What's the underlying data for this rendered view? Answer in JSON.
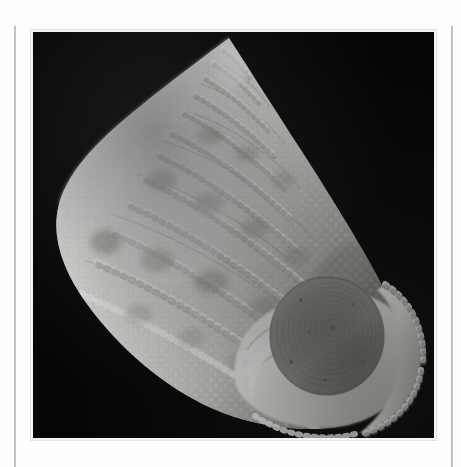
{
  "page": {
    "background_color": "#fefefe",
    "width": 461,
    "height": 467,
    "caption": ""
  },
  "margin_rules": {
    "left_label": "left-margin-rule",
    "right_label": "right-margin-rule",
    "color": "#7e7e7e"
  },
  "plate": {
    "label": "specimen-photograph",
    "background_color": "#050505",
    "border_color": "#e2e2e2",
    "subject": "marine gastropod shell",
    "view": "apertural / oblique apical view",
    "lighting": "top-left key light"
  },
  "specimen": {
    "name": "beaded top shell",
    "shell_color_light": "#fdfdfc",
    "shell_color_mid": "#dadad4",
    "shell_color_shadow": "#8e8e88",
    "band_blotch_color": "#9a9a94",
    "aperture_color": "#f3f2ec",
    "operculum_color": "#8e8d86",
    "operculum_center": "#79786f",
    "apex": {
      "x": 228,
      "y": 38
    },
    "spiral_rows": 18,
    "beads_per_row_max": 34,
    "blotch_bands": 3,
    "operculum": {
      "cx": 326,
      "cy": 336,
      "r": 57,
      "rings": 11
    }
  }
}
